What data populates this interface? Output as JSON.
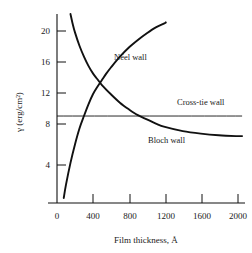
{
  "chart_data": {
    "type": "line",
    "title": "",
    "xlabel": "Film thickness, Å",
    "ylabel": "γ (erg/cm²)",
    "xlim": [
      0,
      2070
    ],
    "ylim": [
      0,
      22.6
    ],
    "grid": false,
    "legend": "inline-annotations",
    "xticks": [
      0,
      400,
      800,
      1200,
      1600,
      2000
    ],
    "xtick_labels": [
      "0",
      "400",
      "800",
      "1200",
      "1600",
      "2000"
    ],
    "yticks": [
      4,
      8,
      12,
      16,
      20
    ],
    "ytick_labels": [
      "4",
      "8",
      "12",
      "16",
      "20"
    ],
    "series": [
      {
        "name": "Bloch wall",
        "label": "Bloch wall",
        "color": "#111111",
        "x": [
          150,
          175,
          200,
          250,
          300,
          350,
          400,
          450,
          500,
          600,
          700,
          800,
          900,
          1000,
          1100,
          1200,
          1400,
          1600,
          1800,
          2000,
          2060
        ],
        "y": [
          22.6,
          21.4,
          20.4,
          18.8,
          17.5,
          16.4,
          15.5,
          14.8,
          14.1,
          13.0,
          12.0,
          11.2,
          10.5,
          10.0,
          9.5,
          9.1,
          8.6,
          8.3,
          8.1,
          8.0,
          8.0
        ]
      },
      {
        "name": "Néel wall",
        "label": "Néel wall",
        "color": "#111111",
        "x": [
          75,
          100,
          150,
          200,
          250,
          300,
          350,
          400,
          450,
          500,
          550,
          600,
          700,
          800,
          900,
          1000,
          1100,
          1200,
          1210
        ],
        "y": [
          0.6,
          2.2,
          4.8,
          7.0,
          8.9,
          10.4,
          11.8,
          13.0,
          13.9,
          14.7,
          15.5,
          16.2,
          17.5,
          18.6,
          19.5,
          20.3,
          21.0,
          21.5,
          21.6
        ]
      },
      {
        "name": "Cross-tie wall",
        "label": "Cross-tie wall",
        "color": "#111111",
        "x": [
          0,
          2060
        ],
        "y": [
          10.4,
          10.4
        ]
      }
    ],
    "annotations": [
      {
        "text": "Néel wall",
        "x": 640,
        "y": 18.0
      },
      {
        "text": "Cross-tie wall",
        "x": 1450,
        "y": 11.3
      },
      {
        "text": "Bloch wall",
        "x": 1040,
        "y": 6.9
      }
    ]
  },
  "figure": {
    "background_color": "#ffffff",
    "axis_color": "#111111"
  }
}
